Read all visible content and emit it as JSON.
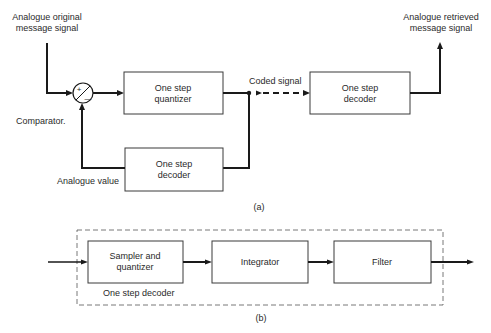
{
  "diagram_a": {
    "caption": "(a)",
    "input_label_line1": "Analogue original",
    "input_label_line2": "message signal",
    "output_label_line1": "Analogue retrieved",
    "output_label_line2": "message signal",
    "comparator_label": "Comparator.",
    "comparator_plus": "+",
    "comparator_minus": "—",
    "coded_signal_label": "Coded signal",
    "feedback_label": "Analogue value",
    "quantizer": {
      "line1": "One step",
      "line2": "quantizer"
    },
    "decoder_out": {
      "line1": "One step",
      "line2": "decoder"
    },
    "decoder_feedback": {
      "line1": "One step",
      "line2": "decoder"
    }
  },
  "diagram_b": {
    "caption": "(b)",
    "group_label": "One step decoder",
    "sampler": {
      "line1": "Sampler and",
      "line2": "quantizer"
    },
    "integrator": {
      "label": "Integrator"
    },
    "filter": {
      "label": "Filter"
    }
  }
}
